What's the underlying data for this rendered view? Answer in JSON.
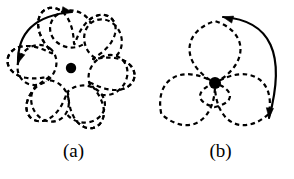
{
  "figure": {
    "background_color": "#ffffff",
    "ink_color": "#000000",
    "panels": [
      {
        "id": "a",
        "caption": "(a)",
        "center_dot": {
          "x": 71,
          "y": 68,
          "r": 5.2,
          "color": "#000000"
        },
        "curve": {
          "style": "dashed",
          "dash_pattern": "4.5 3.5",
          "stroke_width": 2.2,
          "type": "epitrochoid-rosette",
          "loops": 6,
          "loop_centers": [
            {
              "x": 71,
              "y": 29
            },
            {
              "x": 103,
              "y": 40
            },
            {
              "x": 108,
              "y": 75
            },
            {
              "x": 84,
              "y": 104
            },
            {
              "x": 50,
              "y": 101
            },
            {
              "x": 37,
              "y": 65
            }
          ],
          "loop_radius": 21,
          "rotation_deg": 8
        },
        "arrow": {
          "style": "solid",
          "stroke_width": 2.2,
          "double_headed": true,
          "start": {
            "x": 18,
            "y": 63
          },
          "end": {
            "x": 72,
            "y": 12
          },
          "control": {
            "x": 17,
            "y": 17
          },
          "head_start_angle_deg": 110,
          "head_end_angle_deg": 10
        }
      },
      {
        "id": "b",
        "caption": "(b)",
        "center_dot": {
          "x": 68,
          "y": 83,
          "r": 6.0,
          "color": "#000000"
        },
        "curve": {
          "style": "dashed",
          "dash_pattern": "4.5 3.5",
          "stroke_width": 2.2,
          "type": "three-petal-rose",
          "petals": 3,
          "petal_length": 62,
          "petal_width": 34,
          "petal_angles_deg": [
            270,
            30,
            150
          ],
          "inner_petal": {
            "length": 24,
            "width": 20,
            "angle_deg": 90
          }
        },
        "arrow": {
          "style": "solid",
          "stroke_width": 2.2,
          "double_headed": true,
          "start": {
            "x": 122,
            "y": 118
          },
          "end": {
            "x": 76,
            "y": 17
          },
          "control": {
            "x": 148,
            "y": 22
          },
          "head_start_angle_deg": 95,
          "head_end_angle_deg": 195
        }
      }
    ]
  }
}
